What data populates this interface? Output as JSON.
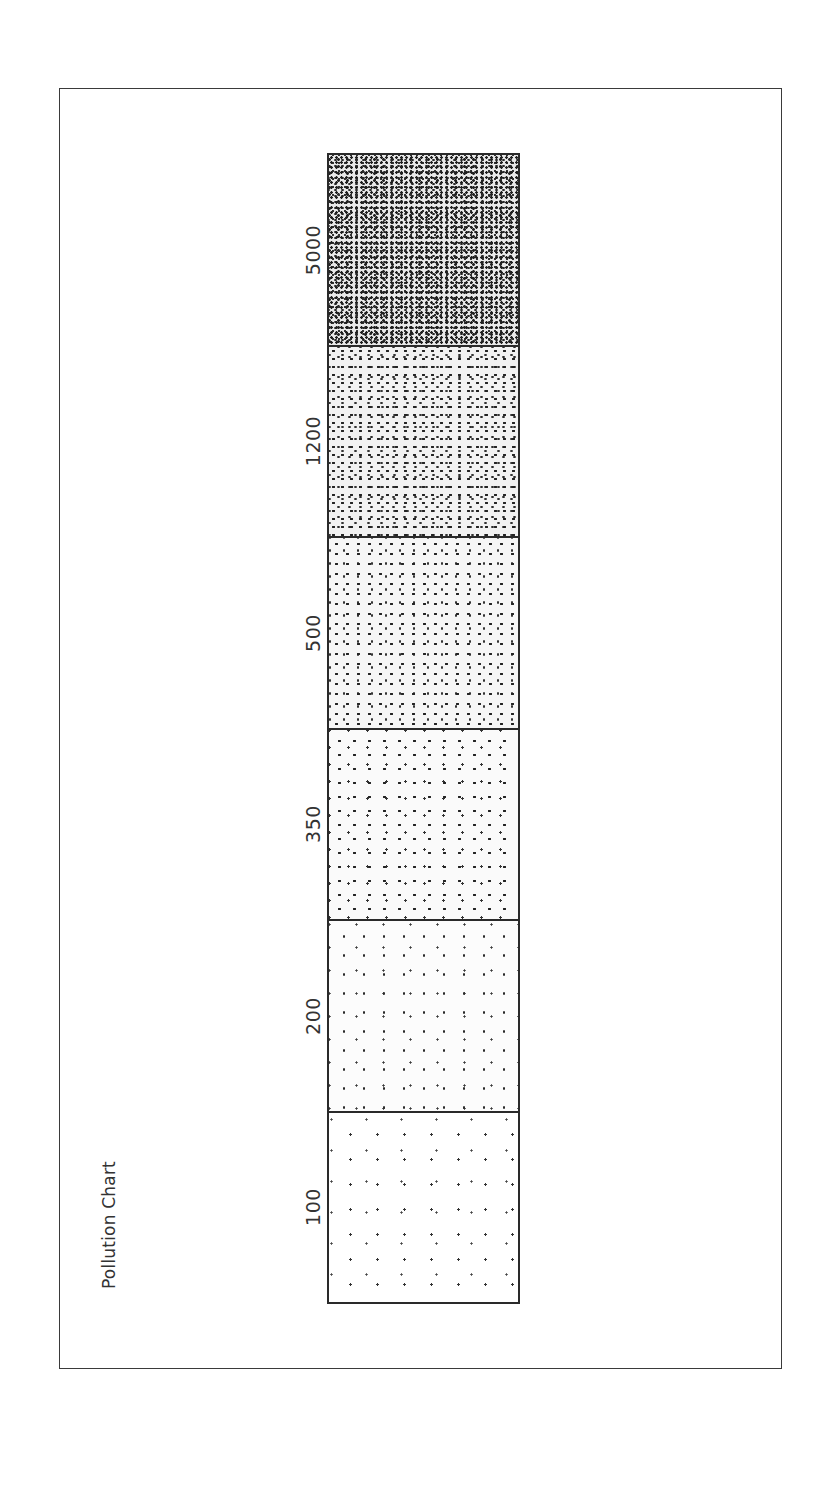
{
  "chart_data": {
    "type": "heatmap",
    "title": "Pollution Chart",
    "orientation": "rotated -90deg (labels read bottom-to-top)",
    "categories": [
      "5000",
      "1200",
      "500",
      "350",
      "200",
      "100"
    ],
    "values": [
      5000,
      1200,
      500,
      350,
      200,
      100
    ],
    "encoding": "stipple dot density increases with value",
    "density_rank": [
      6,
      5,
      4,
      3,
      2,
      1
    ],
    "xlabel": "",
    "ylabel": "",
    "grid": false,
    "legend": false
  },
  "title": "Pollution Chart",
  "segments": [
    {
      "label": "5000",
      "density": "d6"
    },
    {
      "label": "1200",
      "density": "d5"
    },
    {
      "label": "500",
      "density": "d4"
    },
    {
      "label": "350",
      "density": "d3"
    },
    {
      "label": "200",
      "density": "d2"
    },
    {
      "label": "100",
      "density": "d1"
    }
  ],
  "colors": {
    "ink": "#2a2a2a",
    "text": "#333333",
    "background": "#ffffff"
  }
}
